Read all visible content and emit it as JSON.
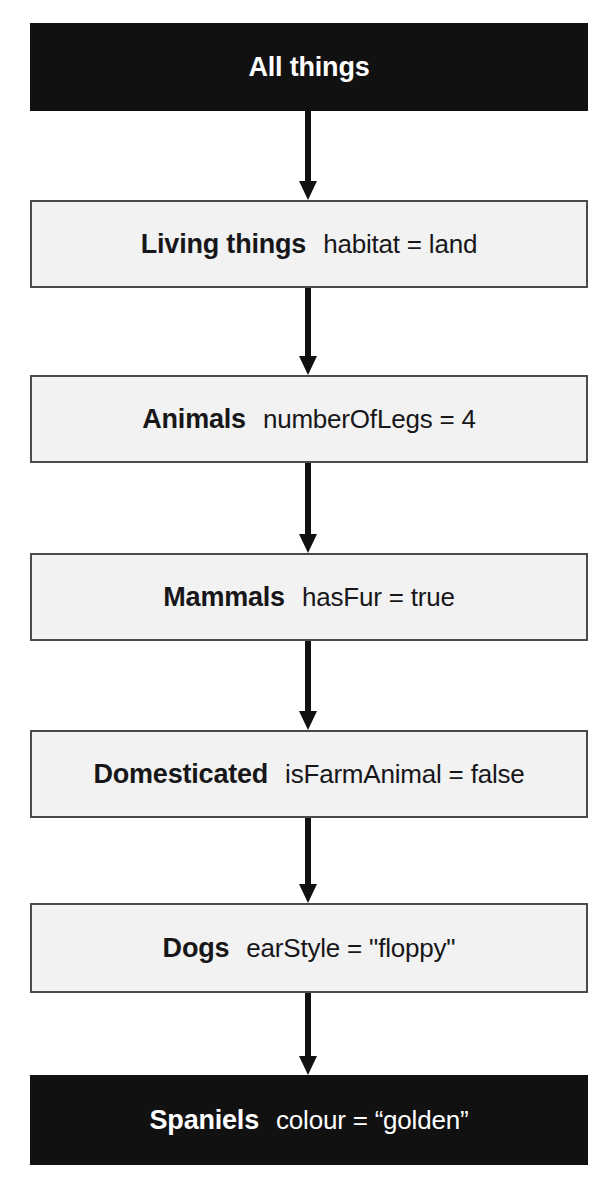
{
  "diagram": {
    "type": "flowchart-vertical",
    "colors": {
      "dark_fill": "#111111",
      "dark_text": "#ffffff",
      "light_fill": "#f2f2f2",
      "light_text": "#17171a",
      "border": "#4a4a4a",
      "arrow": "#111111"
    },
    "nodes": [
      {
        "id": "all-things",
        "label": "All things",
        "attribute": "",
        "style": "dark"
      },
      {
        "id": "living-things",
        "label": "Living things",
        "attribute": "habitat = land",
        "style": "light"
      },
      {
        "id": "animals",
        "label": "Animals",
        "attribute": "numberOfLegs = 4",
        "style": "light"
      },
      {
        "id": "mammals",
        "label": "Mammals",
        "attribute": "hasFur = true",
        "style": "light"
      },
      {
        "id": "domesticated",
        "label": "Domesticated",
        "attribute": "isFarmAnimal = false",
        "style": "light"
      },
      {
        "id": "dogs",
        "label": "Dogs",
        "attribute": "earStyle = \"floppy\"",
        "style": "light"
      },
      {
        "id": "spaniels",
        "label": "Spaniels",
        "attribute": "colour = “golden”",
        "style": "dark"
      }
    ],
    "edges": [
      {
        "id": "edge-all-things-living-things",
        "from": "All things",
        "to": "Living things",
        "direction": "down"
      },
      {
        "id": "edge-living-things-animals",
        "from": "Living things",
        "to": "Animals",
        "direction": "down"
      },
      {
        "id": "edge-animals-mammals",
        "from": "Animals",
        "to": "Mammals",
        "direction": "down"
      },
      {
        "id": "edge-mammals-domesticated",
        "from": "Mammals",
        "to": "Domesticated",
        "direction": "down"
      },
      {
        "id": "edge-domesticated-dogs",
        "from": "Domesticated",
        "to": "Dogs",
        "direction": "down"
      },
      {
        "id": "edge-dogs-spaniels",
        "from": "Dogs",
        "to": "Spaniels",
        "direction": "down"
      }
    ]
  }
}
